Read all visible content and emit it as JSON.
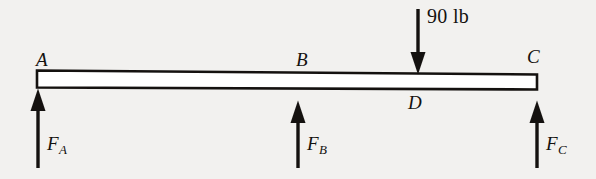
{
  "figure": {
    "type": "free-body-diagram",
    "background_color": "#f2f1ef",
    "ink_color": "#14110f"
  },
  "beam": {
    "name": "beam",
    "left_point": "A",
    "right_point": "C"
  },
  "points": [
    {
      "label": "A",
      "x": 38,
      "y": 61,
      "position": "above-left-end"
    },
    {
      "label": "B",
      "x": 298,
      "y": 61,
      "position": "above-beam"
    },
    {
      "label": "C",
      "x": 534,
      "y": 58,
      "position": "above-right-end"
    },
    {
      "label": "D",
      "x": 415,
      "y": 101,
      "position": "below-beam"
    }
  ],
  "applied_load": {
    "label": "90 lb",
    "magnitude": 90,
    "unit": "lb",
    "direction": "down",
    "applied_at": "D",
    "x": 418
  },
  "reactions": [
    {
      "base": "F",
      "subscript": "A",
      "direction": "up",
      "applied_at": "A",
      "x": 38
    },
    {
      "base": "F",
      "subscript": "B",
      "direction": "up",
      "applied_at": "B",
      "x": 298
    },
    {
      "base": "F",
      "subscript": "C",
      "direction": "up",
      "applied_at": "C",
      "x": 537
    }
  ]
}
